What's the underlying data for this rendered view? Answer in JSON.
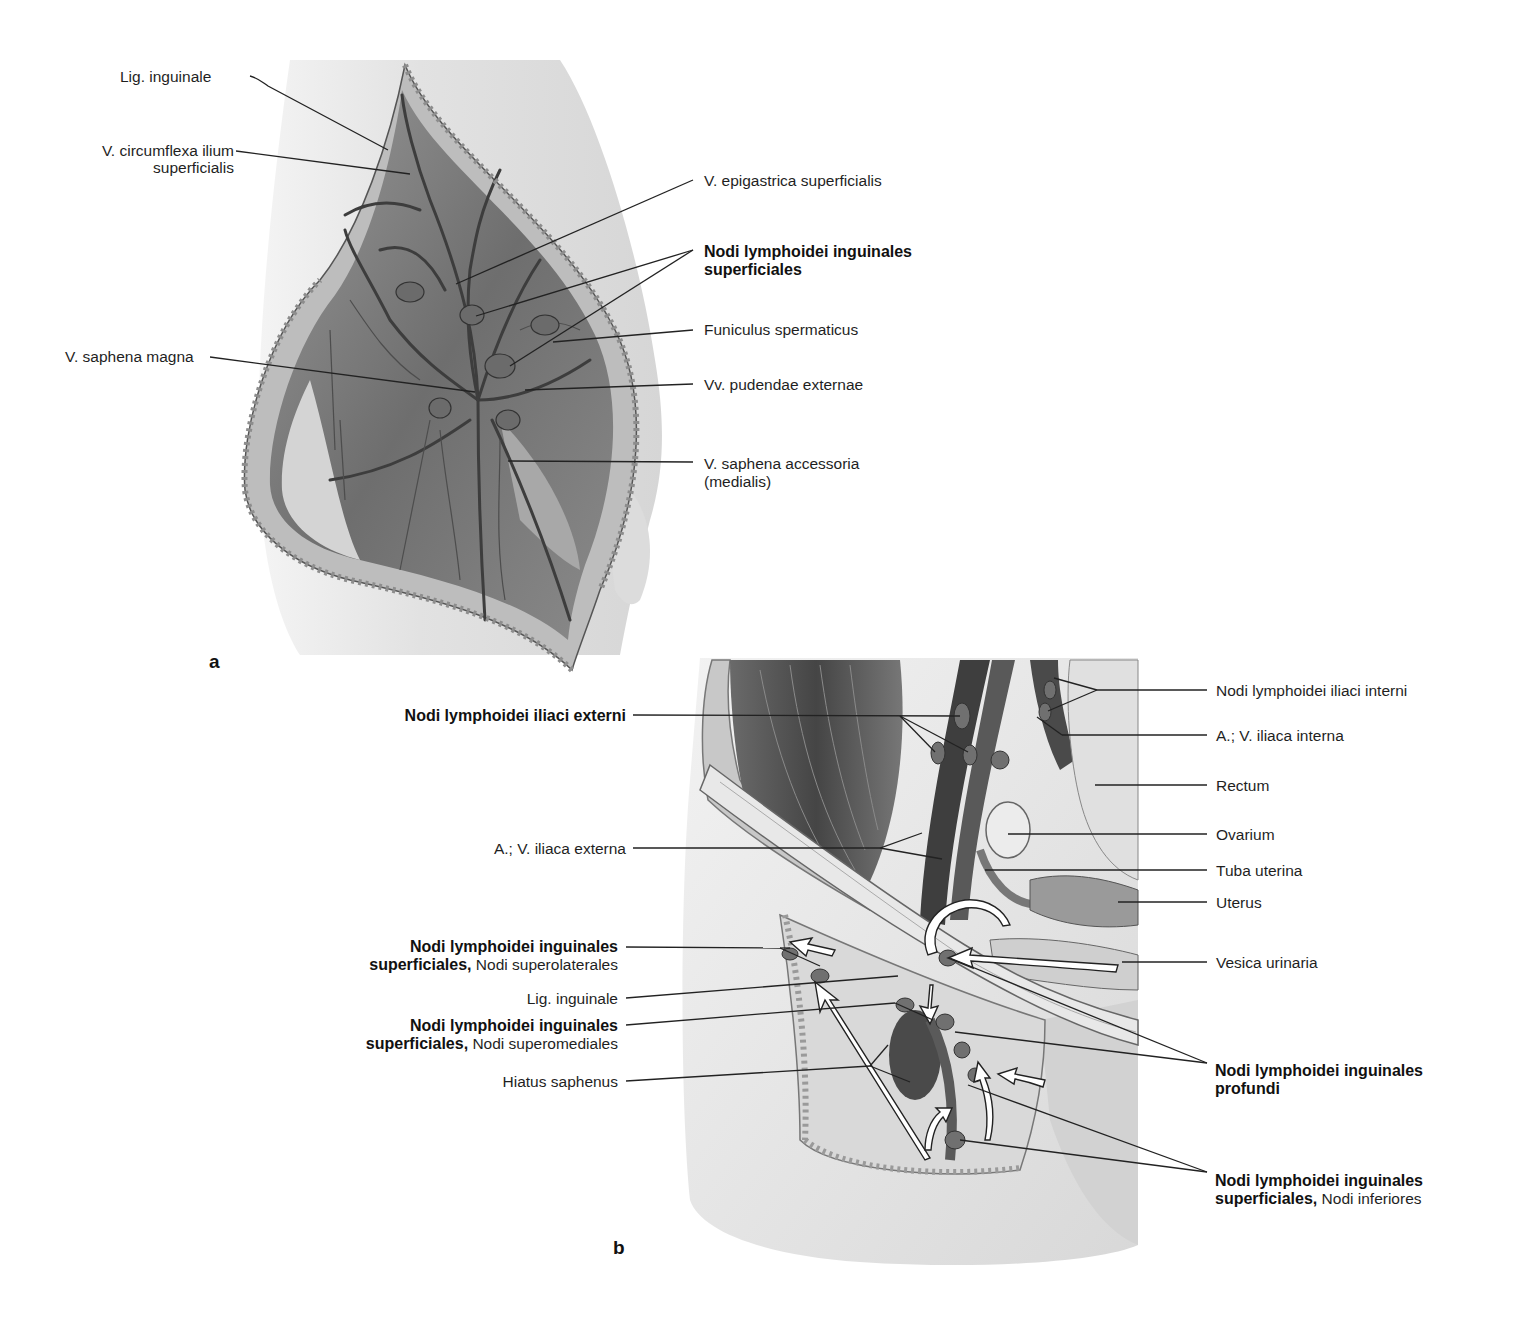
{
  "figure": {
    "panels": [
      {
        "id": "a",
        "letter": "a",
        "labels": {
          "lig_inguinale": "Lig. inguinale",
          "v_circumflexa_1": "V. circumflexa ilium",
          "v_circumflexa_2": "superficialis",
          "v_epigastrica": "V. epigastrica superficialis",
          "nodi_superficiales_1": "Nodi lymphoidei inguinales",
          "nodi_superficiales_2": "superficiales",
          "funiculus": "Funiculus spermaticus",
          "v_saphena_magna": "V. saphena magna",
          "vv_pudendae": "Vv. pudendae externae",
          "v_saphena_accessoria_1": "V. saphena accessoria",
          "v_saphena_accessoria_2": "(medialis)"
        }
      },
      {
        "id": "b",
        "letter": "b",
        "labels": {
          "nodi_iliaci_externi": "Nodi lymphoidei iliaci externi",
          "a_v_iliaca_externa": "A.; V. iliaca externa",
          "nodi_superolaterales_bold_1": "Nodi lymphoidei inguinales",
          "nodi_superolaterales_bold_2": "superficiales,",
          "nodi_superolaterales_normal": " Nodi superolaterales",
          "lig_inguinale": "Lig. inguinale",
          "nodi_superomediales_bold_1": "Nodi lymphoidei inguinales",
          "nodi_superomediales_bold_2": "superficiales,",
          "nodi_superomediales_normal": " Nodi superomediales",
          "hiatus_saphenus": "Hiatus saphenus",
          "nodi_iliaci_interni": "Nodi lymphoidei iliaci interni",
          "a_v_iliaca_interna": "A.; V. iliaca interna",
          "rectum": "Rectum",
          "ovarium": "Ovarium",
          "tuba_uterina": "Tuba uterina",
          "uterus": "Uterus",
          "vesica_urinaria": "Vesica urinaria",
          "nodi_profundi_1": "Nodi lymphoidei inguinales",
          "nodi_profundi_2": "profundi",
          "nodi_inferiores_bold_1": "Nodi lymphoidei inguinales",
          "nodi_inferiores_bold_2": "superficiales,",
          "nodi_inferiores_normal": " Nodi inferiores"
        }
      }
    ],
    "colors": {
      "background": "#ffffff",
      "skin": "#e6e6e6",
      "tissue_dark": "#5a5a5a",
      "tissue_mid": "#8c8c8c",
      "leader_line": "#222222",
      "arrow_fill": "#ffffff"
    }
  }
}
